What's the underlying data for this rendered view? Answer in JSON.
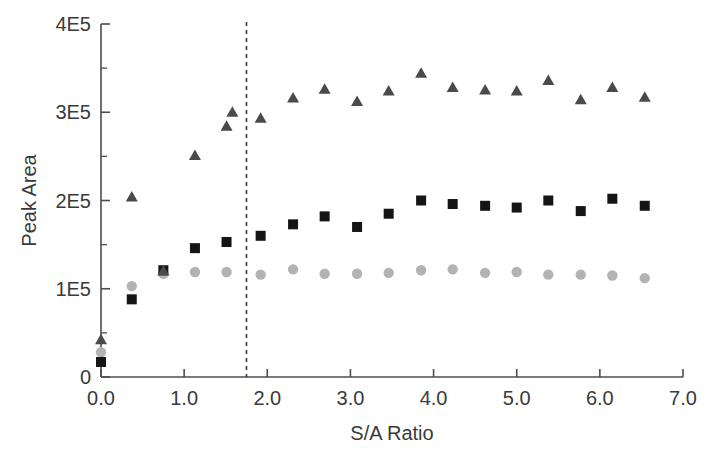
{
  "chart_data": {
    "type": "scatter",
    "title": "",
    "xlabel": "S/A Ratio",
    "ylabel": "Peak Area",
    "xlim": [
      0.0,
      7.0
    ],
    "ylim": [
      0,
      400000
    ],
    "xticks": [
      0.0,
      1.0,
      2.0,
      3.0,
      4.0,
      5.0,
      6.0,
      7.0
    ],
    "xticklabels": [
      "0.0",
      "1.0",
      "2.0",
      "3.0",
      "4.0",
      "5.0",
      "6.0",
      "7.0"
    ],
    "yticks": [
      0,
      100000,
      200000,
      300000,
      400000
    ],
    "yticklabels": [
      "0",
      "1E5",
      "2E5",
      "3E5",
      "4E5"
    ],
    "y_minor_ticks": [
      50000,
      150000,
      250000,
      350000
    ],
    "grid": false,
    "legend": "none",
    "annotations": [
      {
        "name": "vertical-reference-line",
        "type": "vline",
        "x": 1.75,
        "style": "dashed",
        "label": ""
      }
    ],
    "series": [
      {
        "name": "Series A",
        "marker": "triangle",
        "color": "#4a4a4a",
        "points": [
          {
            "x": 0.0,
            "y": 42000
          },
          {
            "x": 0.37,
            "y": 204000
          },
          {
            "x": 0.75,
            "y": 120000
          },
          {
            "x": 1.13,
            "y": 251000
          },
          {
            "x": 1.51,
            "y": 284000
          },
          {
            "x": 1.58,
            "y": 300000
          },
          {
            "x": 1.92,
            "y": 293000
          },
          {
            "x": 2.31,
            "y": 316000
          },
          {
            "x": 2.69,
            "y": 326000
          },
          {
            "x": 3.08,
            "y": 312000
          },
          {
            "x": 3.46,
            "y": 324000
          },
          {
            "x": 3.85,
            "y": 344000
          },
          {
            "x": 4.23,
            "y": 328000
          },
          {
            "x": 4.62,
            "y": 325000
          },
          {
            "x": 5.0,
            "y": 324000
          },
          {
            "x": 5.38,
            "y": 336000
          },
          {
            "x": 5.77,
            "y": 314000
          },
          {
            "x": 6.15,
            "y": 328000
          },
          {
            "x": 6.54,
            "y": 317000
          }
        ]
      },
      {
        "name": "Series B",
        "marker": "square",
        "color": "#151515",
        "points": [
          {
            "x": 0.0,
            "y": 17000
          },
          {
            "x": 0.37,
            "y": 88000
          },
          {
            "x": 0.75,
            "y": 121000
          },
          {
            "x": 1.13,
            "y": 146000
          },
          {
            "x": 1.51,
            "y": 153000
          },
          {
            "x": 1.92,
            "y": 160000
          },
          {
            "x": 2.31,
            "y": 173000
          },
          {
            "x": 2.69,
            "y": 182000
          },
          {
            "x": 3.08,
            "y": 170000
          },
          {
            "x": 3.46,
            "y": 185000
          },
          {
            "x": 3.85,
            "y": 200000
          },
          {
            "x": 4.23,
            "y": 196000
          },
          {
            "x": 4.62,
            "y": 194000
          },
          {
            "x": 5.0,
            "y": 192000
          },
          {
            "x": 5.38,
            "y": 200000
          },
          {
            "x": 5.77,
            "y": 188000
          },
          {
            "x": 6.15,
            "y": 202000
          },
          {
            "x": 6.54,
            "y": 194000
          }
        ]
      },
      {
        "name": "Series C",
        "marker": "circle",
        "color": "#b3b3b3",
        "points": [
          {
            "x": 0.0,
            "y": 28000
          },
          {
            "x": 0.37,
            "y": 103000
          },
          {
            "x": 0.75,
            "y": 117000
          },
          {
            "x": 1.13,
            "y": 119000
          },
          {
            "x": 1.51,
            "y": 119000
          },
          {
            "x": 1.92,
            "y": 116000
          },
          {
            "x": 2.31,
            "y": 122000
          },
          {
            "x": 2.69,
            "y": 117000
          },
          {
            "x": 3.08,
            "y": 117000
          },
          {
            "x": 3.46,
            "y": 118000
          },
          {
            "x": 3.85,
            "y": 121000
          },
          {
            "x": 4.23,
            "y": 122000
          },
          {
            "x": 4.62,
            "y": 118000
          },
          {
            "x": 5.0,
            "y": 119000
          },
          {
            "x": 5.38,
            "y": 116000
          },
          {
            "x": 5.77,
            "y": 116000
          },
          {
            "x": 6.15,
            "y": 115000
          },
          {
            "x": 6.54,
            "y": 112000
          }
        ]
      }
    ]
  }
}
